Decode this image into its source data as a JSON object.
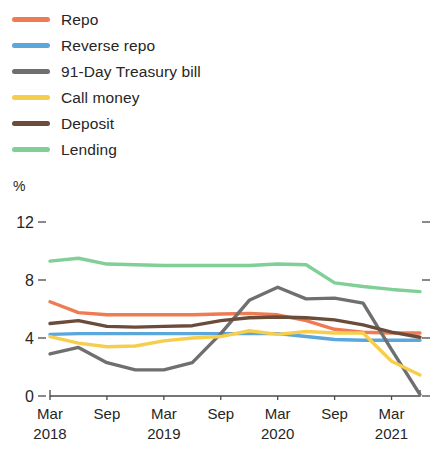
{
  "chart_data": {
    "type": "line",
    "title": "",
    "subtitle": "",
    "xlabel": "",
    "ylabel": "%",
    "ylim": [
      0,
      12
    ],
    "yticks": [
      0,
      4,
      8,
      12
    ],
    "ytick_labels": [
      "0",
      "4",
      "8",
      "12"
    ],
    "grid": false,
    "legend_position": "top-left",
    "x_tick_labels": [
      {
        "month": "Mar",
        "year": "2018"
      },
      {
        "month": "Sep",
        "year": ""
      },
      {
        "month": "Mar",
        "year": "2019"
      },
      {
        "month": "Sep",
        "year": ""
      },
      {
        "month": "Mar",
        "year": "2020"
      },
      {
        "month": "Sep",
        "year": ""
      },
      {
        "month": "Mar",
        "year": "2021"
      }
    ],
    "x": [
      "Mar 2018",
      "Jun 2018",
      "Sep 2018",
      "Dec 2018",
      "Mar 2019",
      "Jun 2019",
      "Sep 2019",
      "Dec 2019",
      "Mar 2020",
      "Jun 2020",
      "Sep 2020",
      "Dec 2020",
      "Mar 2021",
      "Jun 2021"
    ],
    "series": [
      {
        "name": "Repo",
        "color": "#ef7b52",
        "values": [
          6.5,
          5.75,
          5.6,
          5.6,
          5.6,
          5.6,
          5.65,
          5.7,
          5.6,
          5.2,
          4.6,
          4.4,
          4.35,
          4.35
        ]
      },
      {
        "name": "Reverse repo",
        "color": "#5ba7dc",
        "values": [
          4.25,
          4.3,
          4.3,
          4.3,
          4.3,
          4.3,
          4.3,
          4.3,
          4.3,
          4.1,
          3.9,
          3.85,
          3.85,
          3.85
        ]
      },
      {
        "name": "91-Day Treasury bill",
        "color": "#6f6f6f",
        "values": [
          2.9,
          3.35,
          2.3,
          1.8,
          1.8,
          2.3,
          4.3,
          6.6,
          7.5,
          6.7,
          6.75,
          6.4,
          3.2,
          0.1
        ]
      },
      {
        "name": "Call money",
        "color": "#f7ce4c",
        "values": [
          4.1,
          3.65,
          3.4,
          3.45,
          3.8,
          4.0,
          4.1,
          4.5,
          4.25,
          4.45,
          4.35,
          4.35,
          2.4,
          1.45
        ]
      },
      {
        "name": "Deposit",
        "color": "#6b4c3b",
        "values": [
          5.0,
          5.2,
          4.8,
          4.75,
          4.8,
          4.85,
          5.2,
          5.4,
          5.45,
          5.4,
          5.25,
          4.9,
          4.4,
          4.05
        ]
      },
      {
        "name": "Lending",
        "color": "#7fcf97",
        "values": [
          9.3,
          9.5,
          9.1,
          9.05,
          9.0,
          9.0,
          9.0,
          9.0,
          9.1,
          9.05,
          7.8,
          7.55,
          7.35,
          7.2
        ]
      }
    ],
    "extra_points": {
      "note": "series values continue flat to right axis edge"
    }
  },
  "legend": {
    "items": [
      {
        "label": "Repo",
        "color": "#ef7b52"
      },
      {
        "label": "Reverse repo",
        "color": "#5ba7dc"
      },
      {
        "label": "91-Day Treasury bill",
        "color": "#6f6f6f"
      },
      {
        "label": "Call money",
        "color": "#f7ce4c"
      },
      {
        "label": "Deposit",
        "color": "#6b4c3b"
      },
      {
        "label": "Lending",
        "color": "#7fcf97"
      }
    ]
  },
  "axes": {
    "y_unit": "%"
  }
}
